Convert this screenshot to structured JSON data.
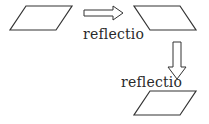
{
  "diagram": {
    "stroke_color": "#333333",
    "shapes": [
      {
        "id": "original",
        "points": "26,6 72,6 56,30 10,30"
      },
      {
        "id": "reflected-1",
        "points": "134,6 180,6 196,30 150,30"
      },
      {
        "id": "reflected-2",
        "points": "150,91 196,91 180,115 134,115"
      }
    ],
    "arrows": [
      {
        "id": "arrow-right",
        "points": "84,10 113,10 113,6 123,13 113,20 113,16 84,16"
      },
      {
        "id": "arrow-down",
        "points": "173,42 181,42 181,67 186,67 177,79 168,67 173,67"
      }
    ],
    "labels": [
      {
        "id": "label-1",
        "text": "reflectio",
        "x": 83,
        "y": 27
      },
      {
        "id": "label-2",
        "text": "reflectio",
        "x": 121,
        "y": 75
      }
    ]
  }
}
